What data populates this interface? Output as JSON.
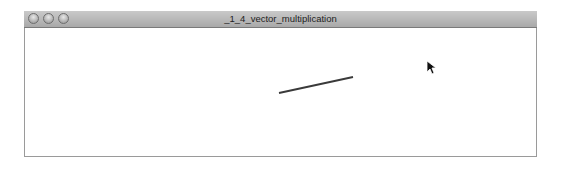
{
  "window": {
    "title": "_1_4_vector_multiplication",
    "controls": [
      "close",
      "minimize",
      "zoom"
    ]
  },
  "sketch": {
    "background": "#ffffff",
    "line": {
      "x1": 279,
      "y1": 93,
      "x2": 353,
      "y2": 77,
      "color": "#3a3a3a",
      "stroke_width": 2
    }
  },
  "cursor": {
    "icon": "arrow-pointer-icon",
    "x": 426,
    "y": 60
  }
}
